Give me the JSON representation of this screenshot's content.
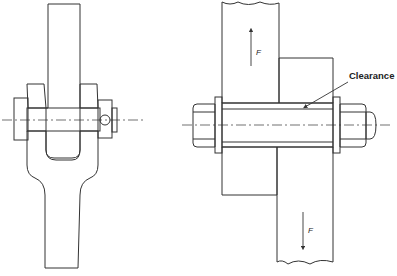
{
  "diagram": {
    "type": "engineering-cross-section",
    "left_figure": {
      "name": "clevis-pin-joint",
      "parts": [
        "rod-eye",
        "fork-clevis",
        "pin",
        "split-pin"
      ]
    },
    "right_figure": {
      "name": "bolted-lap-joint",
      "parts": [
        "upper-plate",
        "lower-plate",
        "bolt",
        "nut",
        "washers"
      ],
      "labels": {
        "clearance": "Clearance",
        "force_top": "F",
        "force_bottom": "F"
      }
    }
  }
}
